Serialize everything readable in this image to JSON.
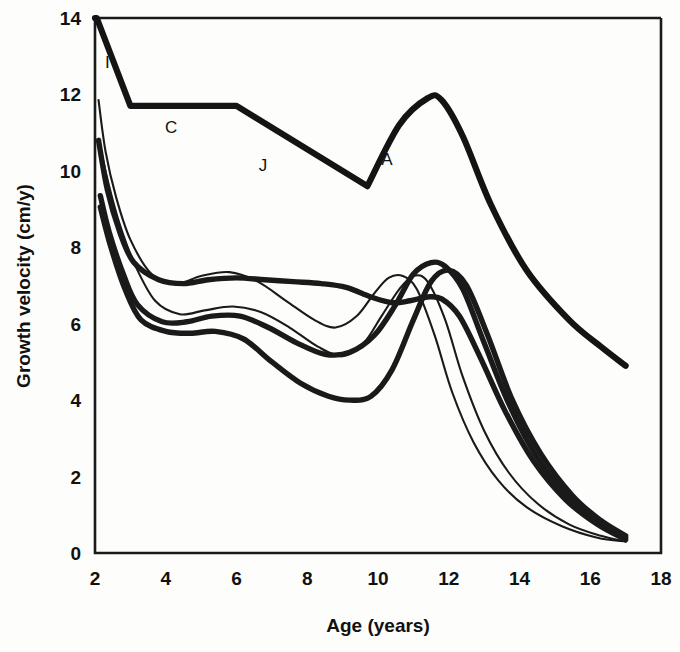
{
  "chart_data": {
    "type": "line",
    "title": "",
    "xlabel": "Age (years)",
    "ylabel": "Growth velocity (cm/y)",
    "xlim": [
      2,
      18
    ],
    "ylim": [
      0,
      14
    ],
    "xticks": [
      2,
      4,
      6,
      8,
      10,
      12,
      14,
      16,
      18
    ],
    "yticks": [
      0,
      2,
      4,
      6,
      8,
      10,
      12,
      14
    ],
    "grid": false,
    "legend": "none",
    "annotations": [
      {
        "text": "I",
        "x": 2.35,
        "y": 12.7,
        "meaning": "infancy-component"
      },
      {
        "text": "C",
        "x": 4.15,
        "y": 11.0,
        "meaning": "childhood-component"
      },
      {
        "text": "J",
        "x": 6.75,
        "y": 10.0,
        "meaning": "juvenile-component"
      },
      {
        "text": "A",
        "x": 10.25,
        "y": 10.15,
        "meaning": "adolescence-component"
      }
    ],
    "series": [
      {
        "name": "ICJA model envelope",
        "style": "very-thick",
        "x": [
          2.0,
          2.05,
          3.0,
          6.0,
          9.7,
          10.6,
          11.4,
          11.8,
          12.4,
          13.2,
          14.2,
          15.4,
          16.3,
          17.0
        ],
        "y": [
          14.0,
          14.0,
          11.7,
          11.7,
          9.6,
          11.2,
          11.9,
          11.85,
          10.9,
          9.1,
          7.4,
          6.1,
          5.4,
          4.9
        ]
      },
      {
        "name": "Individual 1 (thin, early maturer)",
        "style": "thin",
        "x": [
          2.1,
          2.3,
          2.6,
          3.0,
          3.6,
          4.3,
          5.0,
          5.8,
          6.6,
          7.4,
          8.2,
          8.8,
          9.4,
          9.9,
          10.3,
          10.7,
          11.1,
          11.6,
          12.1,
          12.7,
          13.4,
          14.2,
          15.2,
          16.2,
          17.0
        ],
        "y": [
          11.85,
          10.5,
          9.3,
          8.2,
          7.3,
          7.05,
          7.25,
          7.35,
          7.1,
          6.6,
          6.1,
          5.9,
          6.2,
          6.8,
          7.2,
          7.25,
          6.9,
          5.7,
          4.2,
          2.9,
          1.9,
          1.2,
          0.7,
          0.4,
          0.3
        ]
      },
      {
        "name": "Individual 2 (thin)",
        "style": "thin",
        "x": [
          2.15,
          2.4,
          2.7,
          3.1,
          3.7,
          4.4,
          5.1,
          5.9,
          6.7,
          7.5,
          8.3,
          9.0,
          9.6,
          10.1,
          10.6,
          11.0,
          11.4,
          11.9,
          12.4,
          13.0,
          13.7,
          14.5,
          15.4,
          16.3,
          17.0
        ],
        "y": [
          10.6,
          9.6,
          8.6,
          7.6,
          6.6,
          6.25,
          6.35,
          6.45,
          6.3,
          5.9,
          5.4,
          5.15,
          5.5,
          6.2,
          6.9,
          7.25,
          7.1,
          6.1,
          4.6,
          3.2,
          2.1,
          1.3,
          0.75,
          0.45,
          0.3
        ]
      },
      {
        "name": "Individual 3 (thick)",
        "style": "thick",
        "x": [
          2.1,
          2.35,
          2.7,
          3.1,
          3.8,
          4.5,
          5.2,
          6.0,
          6.8,
          7.6,
          8.4,
          9.1,
          9.8,
          10.4,
          10.9,
          11.4,
          11.8,
          12.3,
          12.9,
          13.6,
          14.4,
          15.3,
          16.2,
          17.0
        ],
        "y": [
          10.8,
          9.5,
          8.4,
          7.6,
          7.15,
          7.05,
          7.15,
          7.2,
          7.15,
          7.1,
          7.05,
          6.95,
          6.7,
          6.55,
          6.6,
          6.7,
          6.65,
          6.2,
          5.1,
          3.7,
          2.4,
          1.4,
          0.75,
          0.35
        ]
      },
      {
        "name": "Individual 4 (thick)",
        "style": "thick",
        "x": [
          2.15,
          2.4,
          2.8,
          3.2,
          3.9,
          4.6,
          5.3,
          6.1,
          6.9,
          7.7,
          8.5,
          9.2,
          9.9,
          10.5,
          11.0,
          11.5,
          11.9,
          12.4,
          13.0,
          13.7,
          14.5,
          15.4,
          16.3,
          17.0
        ],
        "y": [
          9.35,
          8.4,
          7.3,
          6.5,
          6.05,
          6.05,
          6.2,
          6.2,
          5.9,
          5.5,
          5.2,
          5.25,
          5.7,
          6.5,
          7.3,
          7.6,
          7.5,
          6.9,
          5.5,
          3.9,
          2.5,
          1.45,
          0.8,
          0.4
        ]
      },
      {
        "name": "Individual 5 (thick, late maturer)",
        "style": "thick",
        "x": [
          2.15,
          2.45,
          2.85,
          3.3,
          4.0,
          4.7,
          5.4,
          6.2,
          7.0,
          7.8,
          8.6,
          9.2,
          9.8,
          10.4,
          11.0,
          11.5,
          12.0,
          12.5,
          13.1,
          13.8,
          14.6,
          15.5,
          16.3,
          17.0
        ],
        "y": [
          9.05,
          8.0,
          6.9,
          6.1,
          5.8,
          5.75,
          5.8,
          5.6,
          5.0,
          4.45,
          4.1,
          4.0,
          4.1,
          4.8,
          6.1,
          7.1,
          7.4,
          7.0,
          5.7,
          4.0,
          2.6,
          1.5,
          0.85,
          0.45
        ]
      }
    ]
  },
  "axes": {
    "x_tick_labels": [
      "2",
      "4",
      "6",
      "8",
      "10",
      "12",
      "14",
      "16",
      "18"
    ],
    "y_tick_labels": [
      "0",
      "2",
      "4",
      "6",
      "8",
      "10",
      "12",
      "14"
    ],
    "x_axis_title": "Age (years)",
    "y_axis_title": "Growth velocity (cm/y)"
  },
  "labels": {
    "infancy": "I",
    "childhood": "C",
    "juvenile": "J",
    "adolescence": "A"
  },
  "colors": {
    "line": "#1a1a1a",
    "axis": "#1a1a1a",
    "background": "#fdfdfb"
  }
}
